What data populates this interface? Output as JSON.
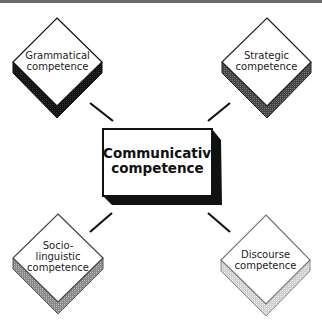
{
  "diagram": {
    "center": {
      "line1": "Communicative",
      "line2": "competence"
    },
    "nodes": [
      {
        "id": "grammatical",
        "lines": [
          "Grammatical",
          "competence"
        ],
        "shadow": "#1a1a1a"
      },
      {
        "id": "strategic",
        "lines": [
          "Strategic",
          "competence"
        ],
        "shadow": "#555555"
      },
      {
        "id": "sociolinguistic",
        "lines": [
          "Socio-",
          "linguistic",
          "competence"
        ],
        "shadow": "#8a8a8a"
      },
      {
        "id": "discourse",
        "lines": [
          "Discourse",
          "competence"
        ],
        "shadow": "#d0d0d0"
      }
    ]
  }
}
